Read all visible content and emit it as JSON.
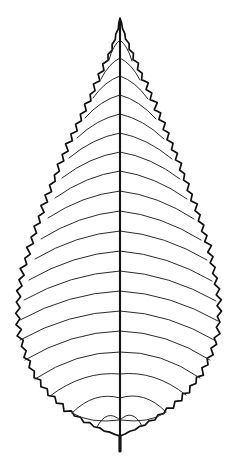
{
  "figure": {
    "kind": "botanical-line-drawing",
    "canvas_width": 239,
    "canvas_height": 473,
    "background_color": "#ffffff",
    "ink_color": "#111111",
    "vein_ink_color": "#2b2b2b",
    "has_visible_text": false,
    "caption": "",
    "label": ""
  },
  "leaf": {
    "outline_shape": "ovate-elliptic",
    "apex_type": "acuminate",
    "base_type": "rounded-slightly-asymmetric",
    "margin_type": "doubly-serrate",
    "venation_type": "pinnate-craspedodromous",
    "symmetry": "near-symmetric",
    "apex_point": {
      "x": 120,
      "y": 18
    },
    "base_point": {
      "x": 120,
      "y": 436
    },
    "widest_y": 292,
    "left_extreme_x": 18,
    "right_extreme_x": 218,
    "lateral_vein_pairs": 19,
    "tooth_count_per_side": 44,
    "midrib": {
      "x": 120,
      "top_y": 22,
      "bottom_y": 436,
      "stroke_width": 2.1
    },
    "petiole": {
      "x": 120,
      "top_y": 436,
      "bottom_y": 451,
      "stroke_width": 3.2
    }
  },
  "geometry": {
    "left_margin_nodes": [
      [
        120,
        18
      ],
      [
        118,
        30
      ],
      [
        114,
        43
      ],
      [
        111,
        52
      ],
      [
        106,
        64
      ],
      [
        102,
        73
      ],
      [
        97,
        85
      ],
      [
        92,
        96
      ],
      [
        87,
        107
      ],
      [
        82,
        118
      ],
      [
        77,
        130
      ],
      [
        71,
        142
      ],
      [
        66,
        154
      ],
      [
        61,
        166
      ],
      [
        56,
        178
      ],
      [
        51,
        190
      ],
      [
        46,
        203
      ],
      [
        42,
        216
      ],
      [
        37,
        229
      ],
      [
        33,
        242
      ],
      [
        29,
        255
      ],
      [
        25,
        268
      ],
      [
        22,
        281
      ],
      [
        20,
        294
      ],
      [
        19,
        307
      ],
      [
        19,
        320
      ],
      [
        21,
        333
      ],
      [
        24,
        346
      ],
      [
        28,
        358
      ],
      [
        33,
        370
      ],
      [
        40,
        381
      ],
      [
        48,
        391
      ],
      [
        58,
        401
      ],
      [
        69,
        410
      ],
      [
        81,
        418
      ],
      [
        93,
        425
      ],
      [
        106,
        431
      ],
      [
        120,
        436
      ]
    ],
    "right_margin_nodes": [
      [
        120,
        18
      ],
      [
        123,
        30
      ],
      [
        127,
        43
      ],
      [
        131,
        53
      ],
      [
        136,
        65
      ],
      [
        141,
        76
      ],
      [
        146,
        88
      ],
      [
        151,
        99
      ],
      [
        156,
        111
      ],
      [
        161,
        123
      ],
      [
        166,
        135
      ],
      [
        171,
        147
      ],
      [
        176,
        159
      ],
      [
        181,
        172
      ],
      [
        186,
        185
      ],
      [
        191,
        198
      ],
      [
        196,
        211
      ],
      [
        200,
        224
      ],
      [
        204,
        237
      ],
      [
        208,
        250
      ],
      [
        211,
        263
      ],
      [
        214,
        276
      ],
      [
        216,
        289
      ],
      [
        218,
        302
      ],
      [
        218,
        315
      ],
      [
        217,
        328
      ],
      [
        214,
        341
      ],
      [
        210,
        353
      ],
      [
        205,
        365
      ],
      [
        198,
        376
      ],
      [
        190,
        387
      ],
      [
        181,
        397
      ],
      [
        171,
        406
      ],
      [
        160,
        414
      ],
      [
        148,
        422
      ],
      [
        135,
        429
      ],
      [
        120,
        436
      ]
    ],
    "lateral_vein_rows": [
      {
        "midrib_y": 40,
        "tip_left": [
          109,
          60
        ],
        "tip_right": [
          132,
          61
        ]
      },
      {
        "midrib_y": 58,
        "tip_left": [
          101,
          79
        ],
        "tip_right": [
          140,
          80
        ]
      },
      {
        "midrib_y": 76,
        "tip_left": [
          93,
          98
        ],
        "tip_right": [
          148,
          99
        ]
      },
      {
        "midrib_y": 95,
        "tip_left": [
          85,
          118
        ],
        "tip_right": [
          156,
          119
        ]
      },
      {
        "midrib_y": 114,
        "tip_left": [
          77,
          138
        ],
        "tip_right": [
          164,
          139
        ]
      },
      {
        "midrib_y": 133,
        "tip_left": [
          69,
          158
        ],
        "tip_right": [
          172,
          159
        ]
      },
      {
        "midrib_y": 152,
        "tip_left": [
          62,
          178
        ],
        "tip_right": [
          180,
          179
        ]
      },
      {
        "midrib_y": 171,
        "tip_left": [
          55,
          198
        ],
        "tip_right": [
          187,
          199
        ]
      },
      {
        "midrib_y": 191,
        "tip_left": [
          48,
          218
        ],
        "tip_right": [
          194,
          219
        ]
      },
      {
        "midrib_y": 211,
        "tip_left": [
          41,
          239
        ],
        "tip_right": [
          201,
          240
        ]
      },
      {
        "midrib_y": 231,
        "tip_left": [
          35,
          259
        ],
        "tip_right": [
          207,
          260
        ]
      },
      {
        "midrib_y": 251,
        "tip_left": [
          29,
          280
        ],
        "tip_right": [
          212,
          281
        ]
      },
      {
        "midrib_y": 271,
        "tip_left": [
          24,
          300
        ],
        "tip_right": [
          216,
          301
        ]
      },
      {
        "midrib_y": 291,
        "tip_left": [
          20,
          320
        ],
        "tip_right": [
          218,
          321
        ]
      },
      {
        "midrib_y": 311,
        "tip_left": [
          20,
          340
        ],
        "tip_right": [
          216,
          341
        ]
      },
      {
        "midrib_y": 331,
        "tip_left": [
          25,
          360
        ],
        "tip_right": [
          210,
          360
        ]
      },
      {
        "midrib_y": 352,
        "tip_left": [
          35,
          379
        ],
        "tip_right": [
          200,
          378
        ]
      },
      {
        "midrib_y": 374,
        "tip_left": [
          50,
          396
        ],
        "tip_right": [
          186,
          395
        ]
      },
      {
        "midrib_y": 398,
        "tip_left": [
          72,
          413
        ],
        "tip_right": [
          166,
          412
        ]
      },
      {
        "midrib_y": 420,
        "tip_left": [
          97,
          427
        ],
        "tip_right": [
          142,
          426
        ]
      }
    ]
  }
}
